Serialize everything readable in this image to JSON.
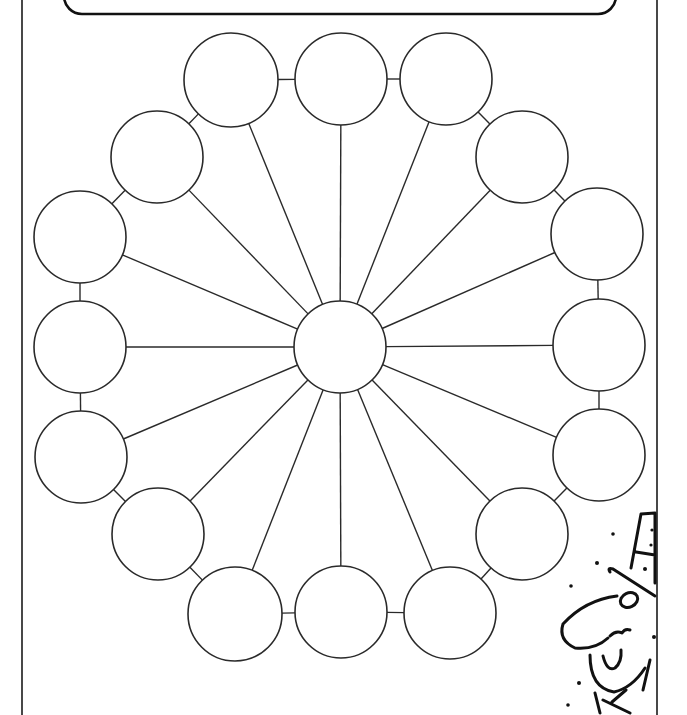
{
  "worksheet": {
    "type": "wheel graphic organizer",
    "title_box_text": "",
    "stroke_color": "#2a2a2a",
    "background_color": "#ffffff"
  },
  "hub": {
    "label": "",
    "cx": 340,
    "cy": 347,
    "r": 46
  },
  "bubbles": [
    {
      "label": "",
      "cx": 231,
      "cy": 80,
      "r": 47
    },
    {
      "label": "",
      "cx": 341,
      "cy": 79,
      "r": 46
    },
    {
      "label": "",
      "cx": 446,
      "cy": 79,
      "r": 46
    },
    {
      "label": "",
      "cx": 522,
      "cy": 157,
      "r": 46
    },
    {
      "label": "",
      "cx": 597,
      "cy": 234,
      "r": 46
    },
    {
      "label": "",
      "cx": 599,
      "cy": 345,
      "r": 46
    },
    {
      "label": "",
      "cx": 599,
      "cy": 455,
      "r": 46
    },
    {
      "label": "",
      "cx": 522,
      "cy": 534,
      "r": 46
    },
    {
      "label": "",
      "cx": 450,
      "cy": 613,
      "r": 46
    },
    {
      "label": "",
      "cx": 341,
      "cy": 612,
      "r": 46
    },
    {
      "label": "",
      "cx": 235,
      "cy": 614,
      "r": 47
    },
    {
      "label": "",
      "cx": 158,
      "cy": 534,
      "r": 46
    },
    {
      "label": "",
      "cx": 81,
      "cy": 457,
      "r": 46
    },
    {
      "label": "",
      "cx": 80,
      "cy": 347,
      "r": 46
    },
    {
      "label": "",
      "cx": 80,
      "cy": 237,
      "r": 46
    },
    {
      "label": "",
      "cx": 157,
      "cy": 157,
      "r": 46
    }
  ],
  "decoration": {
    "name": "cartoon-man-top-hat-bowtie"
  }
}
